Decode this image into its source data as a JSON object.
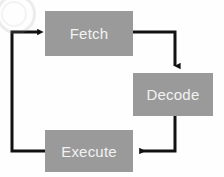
{
  "diagram": {
    "type": "cycle-flowchart",
    "background_color": "#fefefe",
    "box_fill_color": "#9a9a9a",
    "box_text_color": "#f2f2f2",
    "arrow_color": "#111111",
    "nodes": [
      {
        "id": "fetch",
        "label": "Fetch",
        "x": 45,
        "y": 11,
        "width": 88,
        "height": 45
      },
      {
        "id": "decode",
        "label": "Decode",
        "x": 133,
        "y": 73,
        "width": 80,
        "height": 43
      },
      {
        "id": "execute",
        "label": "Execute",
        "x": 45,
        "y": 130,
        "width": 88,
        "height": 42
      }
    ],
    "edges": [
      {
        "id": "fetch-to-decode",
        "from": "fetch",
        "to": "decode",
        "label": "",
        "path": "M 133 32 L 175 32 L 175 68",
        "arrow_direction": "down"
      },
      {
        "id": "decode-to-execute",
        "from": "decode",
        "to": "execute",
        "label": "",
        "path": "M 175 116 L 175 151 L 138 151",
        "arrow_direction": "left"
      },
      {
        "id": "execute-to-fetch",
        "from": "execute",
        "to": "fetch",
        "label": "",
        "path": "M 45 151 L 12 151 L 12 32 L 40 32",
        "arrow_direction": "right"
      }
    ],
    "artifact": {
      "name": "scan-artifact",
      "description": "faint light grey scan smudge in upper-left corner"
    }
  }
}
